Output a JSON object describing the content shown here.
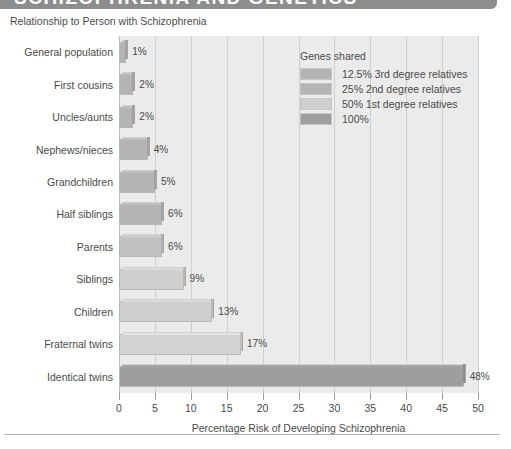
{
  "banner": {
    "title": "SCHIZOPHRENIA AND GENETICS"
  },
  "subtitle": "Relationship to Person with Schizophrenia",
  "legend": {
    "title": "Genes shared",
    "items": [
      {
        "label": "12.5% 3rd degree relatives",
        "color": "#b4b4b4"
      },
      {
        "label": "25% 2nd degree relatives",
        "color": "#b4b4b4"
      },
      {
        "label": "50% 1st degree relatives",
        "color": "#cfcfcf"
      },
      {
        "label": "100%",
        "color": "#9e9e9e"
      }
    ]
  },
  "colors": {
    "plot_background": "#ebebeb",
    "gridline": "#cfcfcf",
    "text": "#4a4a4a",
    "banner": "#8d8d8d",
    "bar_12_5": "#b4b4b4",
    "bar_25": "#b4b4b4",
    "bar_50": "#cfcfcf",
    "bar_100": "#9e9e9e"
  },
  "chart_data": {
    "type": "bar",
    "orientation": "horizontal",
    "title": "SCHIZOPHRENIA AND GENETICS",
    "subtitle": "Relationship to Person with Schizophrenia",
    "xlabel": "Percentage Risk of Developing Schizophrenia",
    "ylabel": "Relationship to Person with Schizophrenia",
    "xlim": [
      0,
      50
    ],
    "xticks": [
      0,
      5,
      10,
      15,
      20,
      25,
      30,
      35,
      40,
      45,
      50
    ],
    "grid": true,
    "legend_position": "upper right",
    "categories": [
      "General population",
      "First cousins",
      "Uncles/aunts",
      "Nephews/nieces",
      "Grandchildren",
      "Half siblings",
      "Parents",
      "Siblings",
      "Children",
      "Fraternal twins",
      "Identical twins"
    ],
    "values": [
      1,
      2,
      2,
      4,
      5,
      6,
      6,
      9,
      13,
      17,
      48
    ],
    "value_labels": [
      "1%",
      "2%",
      "2%",
      "4%",
      "5%",
      "6%",
      "6%",
      "9%",
      "13%",
      "17%",
      "48%"
    ],
    "group": [
      "12.5% 3rd degree relatives",
      "12.5% 3rd degree relatives",
      "25% 2nd degree relatives",
      "25% 2nd degree relatives",
      "25% 2nd degree relatives",
      "25% 2nd degree relatives",
      "50% 1st degree relatives",
      "50% 1st degree relatives",
      "50% 1st degree relatives",
      "50% 1st degree relatives",
      "100%"
    ],
    "bar_colors": [
      "#b4b4b4",
      "#b4b4b4",
      "#b4b4b4",
      "#b4b4b4",
      "#b4b4b4",
      "#b4b4b4",
      "#c2c2c2",
      "#cfcfcf",
      "#cfcfcf",
      "#d4d4d4",
      "#9e9e9e"
    ]
  }
}
